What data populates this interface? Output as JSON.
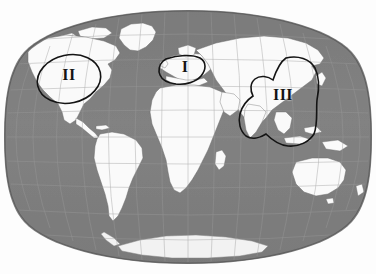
{
  "figure": {
    "kind": "world-map",
    "projection": "pseudocylindrical-oval",
    "background_color": "#fdfdfd",
    "ocean_color": "#808080",
    "land_color": "#fafafa",
    "graticule_color": "#9a9a9a",
    "coastline_color": "#5a5a5a",
    "annotation_color": "#141414"
  },
  "regions": [
    {
      "id": "region-1",
      "label": "I",
      "shape": "closed-curve",
      "area_description": "Europe"
    },
    {
      "id": "region-2",
      "label": "II",
      "shape": "ellipse",
      "area_description": "North America"
    },
    {
      "id": "region-3",
      "label": "III",
      "shape": "closed-curve",
      "area_description": "South and East Asia"
    }
  ],
  "map_features": {
    "continents": [
      "North America",
      "South America",
      "Europe",
      "Africa",
      "Asia",
      "Australia",
      "Antarctica",
      "Greenland"
    ]
  }
}
